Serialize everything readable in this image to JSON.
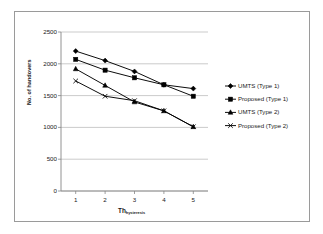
{
  "chart_data": {
    "type": "line",
    "title": "",
    "xlabel": "Th",
    "xlabel_sub": "hysteresis",
    "ylabel": "No. of handovers",
    "x": [
      1,
      2,
      3,
      4,
      5
    ],
    "categories": [
      "1",
      "2",
      "3",
      "4",
      "5"
    ],
    "xticklabels": [
      "1",
      "2",
      "3",
      "4",
      "5"
    ],
    "yticklabels": [
      "0",
      "500",
      "1000",
      "1500",
      "2000",
      "2500"
    ],
    "yticks": [
      0,
      500,
      1000,
      1500,
      2000,
      2500
    ],
    "ylim": [
      0,
      2500
    ],
    "xlim": [
      0.5,
      5.5
    ],
    "grid": "horizontal",
    "legend_position": "right",
    "series": [
      {
        "name": "UMTS (Type 1)",
        "marker": "diamond",
        "color": "#000000",
        "values": [
          2200,
          2050,
          1880,
          1670,
          1610
        ]
      },
      {
        "name": "Proposed (Type 1)",
        "marker": "square",
        "color": "#000000",
        "values": [
          2070,
          1900,
          1780,
          1670,
          1490
        ]
      },
      {
        "name": "UMTS (Type 2)",
        "marker": "triangle",
        "color": "#000000",
        "values": [
          1920,
          1660,
          1400,
          1260,
          1010
        ]
      },
      {
        "name": "Proposed (Type 2)",
        "marker": "cross",
        "color": "#000000",
        "values": [
          1730,
          1490,
          1420,
          1260,
          1010
        ]
      }
    ]
  },
  "figure": {
    "border_color": "#9a9a9a",
    "background": "#ffffff",
    "axis_color": "#868686",
    "grid_color": "#b5b5b5"
  }
}
